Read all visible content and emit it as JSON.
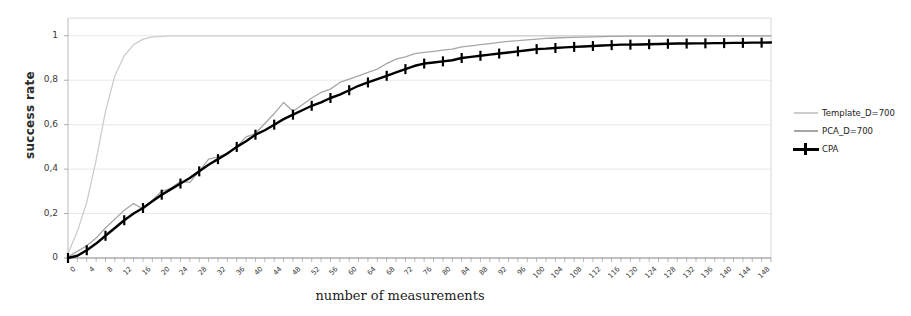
{
  "chart_data": {
    "type": "line",
    "title": "",
    "xlabel": "number of measurements",
    "ylabel": "success rate",
    "xlim": [
      0,
      150
    ],
    "ylim": [
      0,
      1.08
    ],
    "grid": true,
    "legend_position": "right",
    "ytick_labels": [
      "0",
      "0,2",
      "0,4",
      "0,6",
      "0,8",
      "1"
    ],
    "ytick_values": [
      0,
      0.2,
      0.4,
      0.6,
      0.8,
      1
    ],
    "xtick_labels": [
      "0",
      "4",
      "8",
      "12",
      "16",
      "20",
      "24",
      "28",
      "32",
      "36",
      "40",
      "44",
      "48",
      "52",
      "56",
      "60",
      "64",
      "68",
      "72",
      "76",
      "80",
      "84",
      "88",
      "92",
      "96",
      "100",
      "104",
      "108",
      "112",
      "116",
      "120",
      "124",
      "128",
      "132",
      "136",
      "140",
      "144",
      "148"
    ],
    "xtick_values": [
      0,
      4,
      8,
      12,
      16,
      20,
      24,
      28,
      32,
      36,
      40,
      44,
      48,
      52,
      56,
      60,
      64,
      68,
      72,
      76,
      80,
      84,
      88,
      92,
      96,
      100,
      104,
      108,
      112,
      116,
      120,
      124,
      128,
      132,
      136,
      140,
      144,
      148
    ],
    "x": [
      0,
      2,
      4,
      6,
      8,
      10,
      12,
      14,
      16,
      18,
      20,
      22,
      24,
      26,
      28,
      30,
      32,
      34,
      36,
      38,
      40,
      42,
      44,
      46,
      48,
      50,
      52,
      54,
      56,
      58,
      60,
      62,
      64,
      66,
      68,
      70,
      72,
      74,
      76,
      78,
      80,
      82,
      84,
      86,
      88,
      90,
      92,
      94,
      96,
      98,
      100,
      102,
      104,
      106,
      108,
      110,
      112,
      114,
      116,
      118,
      120,
      122,
      124,
      126,
      128,
      130,
      132,
      134,
      136,
      138,
      140,
      142,
      144,
      146,
      148,
      150
    ],
    "series": [
      {
        "name": "Template_D=700",
        "color": "#cdcdcd",
        "marker": "none",
        "values": [
          0.02,
          0.12,
          0.25,
          0.44,
          0.66,
          0.82,
          0.91,
          0.96,
          0.985,
          0.995,
          0.997,
          1.0,
          1.0,
          1.0,
          1.0,
          1.0,
          1.0,
          1.0,
          1.0,
          1.0,
          1.0,
          1.0,
          1.0,
          1.0,
          1.0,
          1.0,
          1.0,
          1.0,
          1.0,
          1.0,
          1.0,
          1.0,
          1.0,
          1.0,
          1.0,
          1.0,
          1.0,
          1.0,
          1.0,
          1.0,
          1.0,
          1.0,
          1.0,
          1.0,
          1.0,
          1.0,
          1.0,
          1.0,
          1.0,
          1.0,
          1.0,
          1.0,
          1.0,
          1.0,
          1.0,
          1.0,
          1.0,
          1.0,
          1.0,
          1.0,
          1.0,
          1.0,
          1.0,
          1.0,
          1.0,
          1.0,
          1.0,
          1.0,
          1.0,
          1.0,
          1.0,
          1.0,
          1.0,
          1.0,
          1.0,
          1.0
        ]
      },
      {
        "name": "PCA_D=700",
        "color": "#a6a6a6",
        "marker": "none",
        "values": [
          0.005,
          0.03,
          0.055,
          0.09,
          0.135,
          0.175,
          0.215,
          0.245,
          0.22,
          0.26,
          0.3,
          0.315,
          0.345,
          0.34,
          0.39,
          0.445,
          0.455,
          0.47,
          0.5,
          0.545,
          0.56,
          0.605,
          0.65,
          0.7,
          0.66,
          0.69,
          0.72,
          0.745,
          0.76,
          0.79,
          0.805,
          0.82,
          0.835,
          0.85,
          0.875,
          0.895,
          0.905,
          0.92,
          0.925,
          0.93,
          0.935,
          0.94,
          0.95,
          0.955,
          0.96,
          0.965,
          0.97,
          0.975,
          0.978,
          0.982,
          0.985,
          0.988,
          0.99,
          0.992,
          0.993,
          0.994,
          0.995,
          0.996,
          0.997,
          0.997,
          0.998,
          0.998,
          0.998,
          0.999,
          0.999,
          0.999,
          1.0,
          1.0,
          1.0,
          1.0,
          1.0,
          1.0,
          1.0,
          1.0,
          1.0,
          1.0
        ]
      },
      {
        "name": "CPA",
        "color": "#000000",
        "marker": "plus",
        "marker_every": 2,
        "values": [
          0.0,
          0.01,
          0.035,
          0.065,
          0.1,
          0.135,
          0.17,
          0.2,
          0.225,
          0.255,
          0.285,
          0.31,
          0.335,
          0.36,
          0.39,
          0.42,
          0.445,
          0.47,
          0.5,
          0.525,
          0.555,
          0.575,
          0.6,
          0.625,
          0.645,
          0.665,
          0.685,
          0.7,
          0.72,
          0.735,
          0.755,
          0.775,
          0.79,
          0.805,
          0.82,
          0.835,
          0.85,
          0.865,
          0.875,
          0.88,
          0.885,
          0.89,
          0.9,
          0.905,
          0.91,
          0.915,
          0.92,
          0.925,
          0.93,
          0.935,
          0.94,
          0.942,
          0.945,
          0.948,
          0.95,
          0.952,
          0.954,
          0.956,
          0.958,
          0.96,
          0.96,
          0.961,
          0.962,
          0.963,
          0.964,
          0.965,
          0.965,
          0.966,
          0.966,
          0.967,
          0.967,
          0.968,
          0.968,
          0.969,
          0.969,
          0.97
        ]
      }
    ]
  },
  "legend": {
    "items": [
      {
        "label": "Template_D=700"
      },
      {
        "label": "PCA_D=700"
      },
      {
        "label": "CPA"
      }
    ]
  }
}
